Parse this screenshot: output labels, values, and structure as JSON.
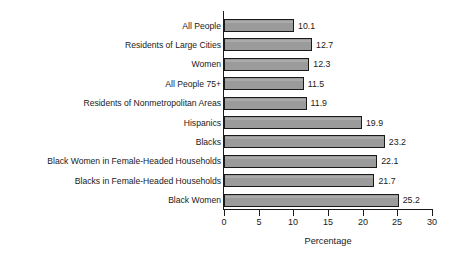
{
  "chart_data": {
    "type": "bar",
    "orientation": "horizontal",
    "title": "",
    "subtitle": "",
    "xlabel": "Percentage",
    "ylabel": "",
    "xlim": [
      0,
      30
    ],
    "xticks": [
      0,
      5,
      10,
      15,
      20,
      25,
      30
    ],
    "xtick_labels": [
      "0",
      "5",
      "10",
      "15",
      "20",
      "25",
      "30"
    ],
    "grid": false,
    "legend": false,
    "bar_color": "#9b9b9b",
    "bar_edge_color": "#1a1a1a",
    "categories": [
      "All People",
      "Residents of Large Cities",
      "Women",
      "All People 75+",
      "Residents of Nonmetropolitan Areas",
      "Hispanics",
      "Blacks",
      "Black Women in Female-Headed Households",
      "Blacks in Female-Headed Households",
      "Black Women"
    ],
    "values": [
      10.1,
      12.7,
      12.3,
      11.5,
      11.9,
      19.9,
      23.2,
      22.1,
      21.7,
      25.2
    ],
    "value_labels": [
      "10.1",
      "12.7",
      "12.3",
      "11.5",
      "11.9",
      "19.9",
      "23.2",
      "22.1",
      "21.7",
      "25.2"
    ]
  }
}
